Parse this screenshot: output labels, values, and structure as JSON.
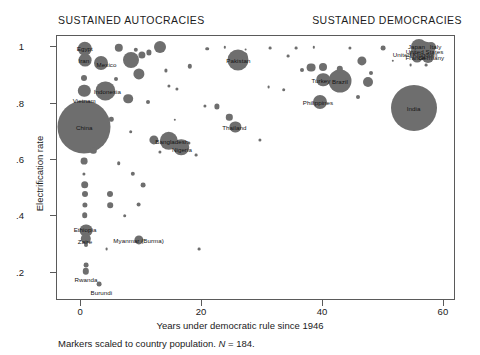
{
  "panel_titles": {
    "left": "SUSTAINED AUTOCRACIES",
    "right": "SUSTAINED DEMOCRACIES"
  },
  "footnote": {
    "prefix": "Markers scaled to country population. ",
    "italic_n": "N",
    "suffix": " = 184."
  },
  "chart_data": {
    "type": "scatter",
    "title": "",
    "xlabel": "Years under democratic rule since 1946",
    "ylabel": "Electrification rate",
    "xlim": [
      -4,
      62
    ],
    "ylim": [
      0.1,
      1.04
    ],
    "xticks": [
      "0",
      "20",
      "40",
      "60"
    ],
    "xtick_values": [
      0,
      20,
      40,
      60
    ],
    "yticks": [
      "1",
      ".8",
      ".6",
      ".4",
      ".2"
    ],
    "ytick_values": [
      1,
      0.8,
      0.6,
      0.4,
      0.2
    ],
    "grid": false,
    "legend": "none",
    "marker_color": "#6e6e6e",
    "size_encoding": "country population",
    "n": 184,
    "points": [
      {
        "name": "Egypt",
        "x": 0.6,
        "y": 0.995,
        "r": 7.2,
        "label": true,
        "label_dx": 0,
        "label_dy": -1
      },
      {
        "name": "Iran",
        "x": 0.6,
        "y": 0.955,
        "r": 6.4,
        "label": true,
        "label_dx": -1,
        "label_dy": 0
      },
      {
        "name": "Mexico",
        "x": 3.2,
        "y": 0.945,
        "r": 7.0,
        "label": true,
        "label_dx": 6,
        "label_dy": 1
      },
      {
        "name": "Vietnam",
        "x": 0.5,
        "y": 0.845,
        "r": 6.2,
        "label": true,
        "label_dx": 0,
        "label_dy": 9
      },
      {
        "name": "Indonesia",
        "x": 4.0,
        "y": 0.845,
        "r": 9.6,
        "label": true,
        "label_dx": 2,
        "label_dy": 0
      },
      {
        "name": "China",
        "x": 0.5,
        "y": 0.718,
        "r": 26.5,
        "label": true,
        "label_dx": 0,
        "label_dy": 0
      },
      {
        "name": "Russia",
        "x": 8.2,
        "y": 0.955,
        "r": 8.0,
        "label": false,
        "label_dx": 0,
        "label_dy": 0
      },
      {
        "name": "Pakistan",
        "x": 26.0,
        "y": 0.955,
        "r": 10.5,
        "label": true,
        "label_dx": 0,
        "label_dy": 0
      },
      {
        "name": "Bangladesh",
        "x": 14.5,
        "y": 0.668,
        "r": 9.2,
        "label": true,
        "label_dx": 3,
        "label_dy": 0
      },
      {
        "name": "Nigeria",
        "x": 16.5,
        "y": 0.645,
        "r": 7.8,
        "label": true,
        "label_dx": 1,
        "label_dy": 2
      },
      {
        "name": "Thailand",
        "x": 25.5,
        "y": 0.718,
        "r": 5.6,
        "label": true,
        "label_dx": -1,
        "label_dy": 0
      },
      {
        "name": "Turkey",
        "x": 40.0,
        "y": 0.885,
        "r": 6.8,
        "label": true,
        "label_dx": -2,
        "label_dy": 0
      },
      {
        "name": "Brazil",
        "x": 42.8,
        "y": 0.88,
        "r": 11.5,
        "label": true,
        "label_dx": 0,
        "label_dy": 0
      },
      {
        "name": "Philippines",
        "x": 39.5,
        "y": 0.805,
        "r": 7.0,
        "label": true,
        "label_dx": -2,
        "label_dy": 0
      },
      {
        "name": "India",
        "x": 55.0,
        "y": 0.785,
        "r": 23.0,
        "label": true,
        "label_dx": 0,
        "label_dy": 0
      },
      {
        "name": "Japan",
        "x": 55.8,
        "y": 1.0,
        "r": 8.0,
        "label": true,
        "label_dx": -2,
        "label_dy": -1
      },
      {
        "name": "Italy",
        "x": 57.8,
        "y": 1.0,
        "r": 5.0,
        "label": true,
        "label_dx": 5,
        "label_dy": -1
      },
      {
        "name": "United States",
        "x": 56.8,
        "y": 0.988,
        "r": 9.5,
        "label": true,
        "label_dx": 0,
        "label_dy": 0
      },
      {
        "name": "United Kingdom",
        "x": 55.4,
        "y": 0.976,
        "r": 6.2,
        "label": true,
        "label_dx": -1,
        "label_dy": 0
      },
      {
        "name": "France",
        "x": 55.6,
        "y": 0.966,
        "r": 5.4,
        "label": true,
        "label_dx": -2,
        "label_dy": 0
      },
      {
        "name": "Germany",
        "x": 57.4,
        "y": 0.964,
        "r": 6.0,
        "label": true,
        "label_dx": 3,
        "label_dy": 0
      },
      {
        "name": "Ethiopia",
        "x": 0.8,
        "y": 0.35,
        "r": 6.4,
        "label": true,
        "label_dx": -1,
        "label_dy": -2
      },
      {
        "name": "Zaire",
        "x": 0.8,
        "y": 0.32,
        "r": 5.2,
        "label": true,
        "label_dx": -1,
        "label_dy": 2
      },
      {
        "name": "Rwanda",
        "x": 0.8,
        "y": 0.205,
        "r": 3.2,
        "label": true,
        "label_dx": 0,
        "label_dy": 8
      },
      {
        "name": "Burundi",
        "x": 3.0,
        "y": 0.16,
        "r": 2.4,
        "label": true,
        "label_dx": 2,
        "label_dy": 8
      },
      {
        "name": "Myanmar (Burma)",
        "x": 9.5,
        "y": 0.318,
        "r": 4.6,
        "label": true,
        "label_dx": 0,
        "label_dy": 0
      },
      {
        "name": "",
        "x": 6.2,
        "y": 0.998,
        "r": 4.2,
        "label": false
      },
      {
        "name": "",
        "x": 9.0,
        "y": 0.992,
        "r": 2.2,
        "label": false
      },
      {
        "name": "",
        "x": 13.0,
        "y": 1.0,
        "r": 6.0,
        "label": false
      },
      {
        "name": "",
        "x": 20.8,
        "y": 0.995,
        "r": 1.8,
        "label": false
      },
      {
        "name": "",
        "x": 23.8,
        "y": 1.0,
        "r": 1.2,
        "label": false
      },
      {
        "name": "",
        "x": 27.2,
        "y": 0.992,
        "r": 1.4,
        "label": false
      },
      {
        "name": "",
        "x": 31.2,
        "y": 0.996,
        "r": 1.4,
        "label": false
      },
      {
        "name": "",
        "x": 35.5,
        "y": 0.998,
        "r": 1.4,
        "label": false
      },
      {
        "name": "",
        "x": 38.5,
        "y": 1.0,
        "r": 1.2,
        "label": false
      },
      {
        "name": "",
        "x": 44.5,
        "y": 0.998,
        "r": 1.6,
        "label": false
      },
      {
        "name": "",
        "x": 50.0,
        "y": 0.998,
        "r": 2.4,
        "label": false
      },
      {
        "name": "",
        "x": 10.0,
        "y": 0.972,
        "r": 3.6,
        "label": false
      },
      {
        "name": "",
        "x": 11.2,
        "y": 0.982,
        "r": 2.6,
        "label": false
      },
      {
        "name": "",
        "x": 27.0,
        "y": 0.972,
        "r": 2.6,
        "label": false
      },
      {
        "name": "",
        "x": 34.2,
        "y": 0.968,
        "r": 1.4,
        "label": false
      },
      {
        "name": "",
        "x": 46.5,
        "y": 0.952,
        "r": 4.6,
        "label": false
      },
      {
        "name": "",
        "x": 18.0,
        "y": 0.932,
        "r": 2.2,
        "label": false
      },
      {
        "name": "",
        "x": 38.0,
        "y": 0.928,
        "r": 4.4,
        "label": false
      },
      {
        "name": "",
        "x": 40.0,
        "y": 0.93,
        "r": 4.0,
        "label": false
      },
      {
        "name": "",
        "x": 42.8,
        "y": 0.922,
        "r": 3.2,
        "label": false
      },
      {
        "name": "",
        "x": 9.5,
        "y": 0.905,
        "r": 5.6,
        "label": false
      },
      {
        "name": "",
        "x": 14.0,
        "y": 0.918,
        "r": 1.6,
        "label": false
      },
      {
        "name": "",
        "x": 36.5,
        "y": 0.918,
        "r": 2.0,
        "label": false
      },
      {
        "name": "",
        "x": 48.0,
        "y": 0.91,
        "r": 2.0,
        "label": false
      },
      {
        "name": "",
        "x": 0.5,
        "y": 0.89,
        "r": 3.0,
        "label": false
      },
      {
        "name": "",
        "x": 5.8,
        "y": 0.888,
        "r": 2.0,
        "label": false
      },
      {
        "name": "",
        "x": 44.0,
        "y": 0.885,
        "r": 1.6,
        "label": false
      },
      {
        "name": "",
        "x": 47.5,
        "y": 0.878,
        "r": 5.0,
        "label": false
      },
      {
        "name": "",
        "x": 14.5,
        "y": 0.862,
        "r": 1.6,
        "label": false
      },
      {
        "name": "",
        "x": 15.8,
        "y": 0.852,
        "r": 1.6,
        "label": false
      },
      {
        "name": "",
        "x": 33.5,
        "y": 0.85,
        "r": 1.8,
        "label": false
      },
      {
        "name": "",
        "x": 7.8,
        "y": 0.818,
        "r": 4.8,
        "label": false
      },
      {
        "name": "",
        "x": 11.0,
        "y": 0.805,
        "r": 2.0,
        "label": false
      },
      {
        "name": "",
        "x": 45.8,
        "y": 0.822,
        "r": 2.0,
        "label": false
      },
      {
        "name": "",
        "x": 22.5,
        "y": 0.79,
        "r": 2.6,
        "label": false
      },
      {
        "name": "",
        "x": 5.0,
        "y": 0.745,
        "r": 2.2,
        "label": false
      },
      {
        "name": "",
        "x": 24.5,
        "y": 0.752,
        "r": 3.2,
        "label": false
      },
      {
        "name": "",
        "x": 8.2,
        "y": 0.7,
        "r": 1.8,
        "label": false
      },
      {
        "name": "",
        "x": 3.4,
        "y": 0.66,
        "r": 2.2,
        "label": false
      },
      {
        "name": "",
        "x": 12.0,
        "y": 0.672,
        "r": 4.6,
        "label": false
      },
      {
        "name": "",
        "x": 17.8,
        "y": 0.662,
        "r": 1.6,
        "label": false
      },
      {
        "name": "",
        "x": 29.5,
        "y": 0.67,
        "r": 1.6,
        "label": false
      },
      {
        "name": "",
        "x": 2.0,
        "y": 0.632,
        "r": 3.2,
        "label": false
      },
      {
        "name": "",
        "x": 13.0,
        "y": 0.628,
        "r": 1.6,
        "label": false
      },
      {
        "name": "",
        "x": 0.5,
        "y": 0.595,
        "r": 3.4,
        "label": false
      },
      {
        "name": "",
        "x": 6.2,
        "y": 0.588,
        "r": 1.8,
        "label": false
      },
      {
        "name": "",
        "x": 0.5,
        "y": 0.552,
        "r": 1.6,
        "label": false
      },
      {
        "name": "",
        "x": 8.5,
        "y": 0.552,
        "r": 2.2,
        "label": false
      },
      {
        "name": "",
        "x": 0.6,
        "y": 0.512,
        "r": 3.8,
        "label": false
      },
      {
        "name": "",
        "x": 10.2,
        "y": 0.512,
        "r": 2.4,
        "label": false
      },
      {
        "name": "",
        "x": 0.6,
        "y": 0.478,
        "r": 3.0,
        "label": false
      },
      {
        "name": "",
        "x": 4.8,
        "y": 0.48,
        "r": 3.0,
        "label": false
      },
      {
        "name": "",
        "x": 0.6,
        "y": 0.442,
        "r": 2.6,
        "label": false
      },
      {
        "name": "",
        "x": 4.8,
        "y": 0.44,
        "r": 2.8,
        "label": false
      },
      {
        "name": "",
        "x": 9.5,
        "y": 0.442,
        "r": 2.4,
        "label": false
      },
      {
        "name": "",
        "x": 0.6,
        "y": 0.405,
        "r": 2.8,
        "label": false
      },
      {
        "name": "",
        "x": 7.2,
        "y": 0.402,
        "r": 1.8,
        "label": false
      },
      {
        "name": "",
        "x": 0.8,
        "y": 0.3,
        "r": 2.0,
        "label": false
      },
      {
        "name": "",
        "x": 4.2,
        "y": 0.285,
        "r": 1.4,
        "label": false
      },
      {
        "name": "",
        "x": 19.5,
        "y": 0.285,
        "r": 1.4,
        "label": false
      },
      {
        "name": "",
        "x": 0.8,
        "y": 0.228,
        "r": 2.4,
        "label": false
      },
      {
        "name": "",
        "x": 15.5,
        "y": 0.742,
        "r": 1.2,
        "label": false
      },
      {
        "name": "",
        "x": 20.5,
        "y": 0.792,
        "r": 1.6,
        "label": false
      },
      {
        "name": "",
        "x": 31.0,
        "y": 0.858,
        "r": 1.4,
        "label": false
      },
      {
        "name": "",
        "x": 19.0,
        "y": 0.618,
        "r": 1.4,
        "label": false
      },
      {
        "name": "",
        "x": 51.5,
        "y": 0.952,
        "r": 1.2,
        "label": false
      },
      {
        "name": "",
        "x": 54.5,
        "y": 0.938,
        "r": 1.4,
        "label": false
      },
      {
        "name": "",
        "x": 57.0,
        "y": 0.938,
        "r": 1.4,
        "label": false
      }
    ]
  }
}
